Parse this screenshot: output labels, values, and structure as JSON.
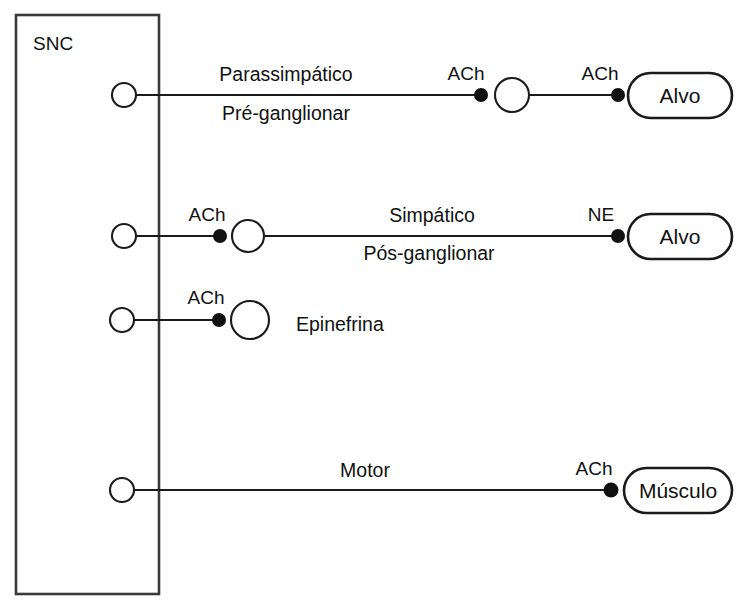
{
  "diagram": {
    "colors": {
      "background": "#ffffff",
      "line": "#1a1a1a",
      "box_stroke": "#3a3a3a",
      "synapse_dot": "#111111",
      "text": "#111111"
    },
    "cns_box": {
      "label": "SNC"
    },
    "pathways": [
      {
        "id": "parasympathetic",
        "name_line1": "Parassimpático",
        "name_line2": "Pré-ganglionar",
        "neurotransmitter_1": "ACh",
        "neurotransmitter_2": "ACh",
        "target": "Alvo"
      },
      {
        "id": "sympathetic",
        "name_line1": "Simpático",
        "name_line2": "Pós-ganglionar",
        "neurotransmitter_1": "ACh",
        "neurotransmitter_2": "NE",
        "target": "Alvo"
      },
      {
        "id": "adrenal",
        "name_line1": "Epinefrina",
        "neurotransmitter_1": "ACh"
      },
      {
        "id": "somatic-motor",
        "name_line1": "Motor",
        "neurotransmitter_1": "ACh",
        "target": "Músculo"
      }
    ]
  }
}
